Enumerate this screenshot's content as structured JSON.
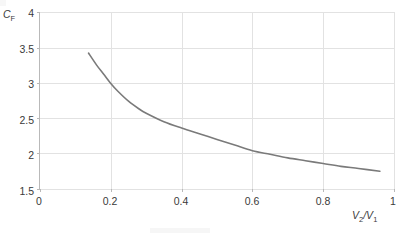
{
  "chart_data": {
    "type": "line",
    "title": "",
    "subtitle": "",
    "xlabel": "V2/V1",
    "xlabel_parts": {
      "base1": "V",
      "sub1": "2",
      "separator": "/",
      "base2": "V",
      "sub2": "1"
    },
    "ylabel": "CF",
    "ylabel_parts": {
      "base": "C",
      "sub": "F"
    },
    "xlim": [
      0,
      1
    ],
    "ylim": [
      1.5,
      4
    ],
    "xticks": [
      0,
      0.2,
      0.4,
      0.6,
      0.8,
      1
    ],
    "xtick_labels": [
      "0",
      "0.2",
      "0.4",
      "0.6",
      "0.8",
      "1"
    ],
    "yticks": [
      1.5,
      2,
      2.5,
      3,
      3.5,
      4
    ],
    "ytick_labels": [
      "1.5",
      "2",
      "2.5",
      "3",
      "3.5",
      "4"
    ],
    "grid": true,
    "grid_color": "#e2e2e2",
    "axis_color": "#b9b9b9",
    "legend": null,
    "legend_position": "none",
    "series": [
      {
        "name": "CF",
        "color": "#7a7a7a",
        "line_width": 1.6,
        "x": [
          0.137,
          0.16,
          0.18,
          0.2,
          0.22,
          0.25,
          0.28,
          0.3,
          0.35,
          0.4,
          0.45,
          0.5,
          0.55,
          0.6,
          0.65,
          0.7,
          0.75,
          0.8,
          0.85,
          0.9,
          0.96
        ],
        "values": [
          3.42,
          3.25,
          3.12,
          2.99,
          2.88,
          2.74,
          2.63,
          2.57,
          2.45,
          2.36,
          2.28,
          2.2,
          2.12,
          2.04,
          1.99,
          1.94,
          1.9,
          1.86,
          1.82,
          1.79,
          1.75
        ]
      }
    ]
  }
}
